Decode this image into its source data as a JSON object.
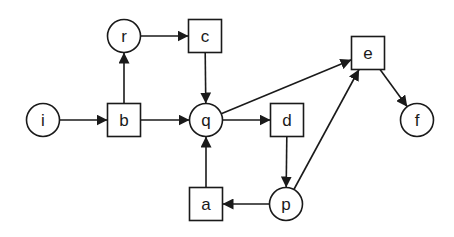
{
  "diagram": {
    "type": "petri-net",
    "stroke_color": "#1a1a1a",
    "background": "#ffffff",
    "places": [
      {
        "id": "i",
        "label": "i",
        "cx": 43,
        "cy": 120
      },
      {
        "id": "r",
        "label": "r",
        "cx": 124,
        "cy": 36
      },
      {
        "id": "q",
        "label": "q",
        "cx": 206,
        "cy": 120
      },
      {
        "id": "p",
        "label": "p",
        "cx": 286,
        "cy": 204
      },
      {
        "id": "f",
        "label": "f",
        "cx": 417,
        "cy": 120
      }
    ],
    "transitions": [
      {
        "id": "b",
        "label": "b",
        "cx": 124,
        "cy": 120
      },
      {
        "id": "c",
        "label": "c",
        "cx": 205,
        "cy": 36
      },
      {
        "id": "d",
        "label": "d",
        "cx": 287,
        "cy": 120
      },
      {
        "id": "a",
        "label": "a",
        "cx": 206,
        "cy": 204
      },
      {
        "id": "e",
        "label": "e",
        "cx": 368,
        "cy": 53
      }
    ],
    "arcs": [
      {
        "from": "i",
        "to": "b"
      },
      {
        "from": "b",
        "to": "r"
      },
      {
        "from": "b",
        "to": "q"
      },
      {
        "from": "r",
        "to": "c"
      },
      {
        "from": "c",
        "to": "q"
      },
      {
        "from": "q",
        "to": "d"
      },
      {
        "from": "q",
        "to": "e"
      },
      {
        "from": "d",
        "to": "p"
      },
      {
        "from": "p",
        "to": "a"
      },
      {
        "from": "a",
        "to": "q"
      },
      {
        "from": "p",
        "to": "e"
      },
      {
        "from": "e",
        "to": "f"
      }
    ]
  }
}
